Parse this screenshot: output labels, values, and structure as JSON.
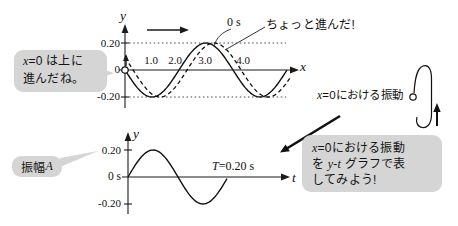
{
  "figure": {
    "top_graph": {
      "y_axis": "y",
      "x_axis": "x",
      "origin": "0",
      "tick_pos": "0.20",
      "tick_neg": "-0.20",
      "x_ticks": [
        "1.0",
        "2.0",
        "3.0",
        "4.0"
      ],
      "label_t0": "0 s",
      "label_advanced": "ちょっと進んだ!"
    },
    "bubble_moved_up": {
      "line1": [
        {
          "t": "x",
          "i": true
        },
        {
          "t": "=0 は上に",
          "i": false
        }
      ],
      "line2": "進んだね。"
    },
    "oscillation_label": [
      {
        "t": "x",
        "i": true
      },
      {
        "t": "=0における振動",
        "i": false
      }
    ],
    "bubble_yt": {
      "line1": [
        {
          "t": "x",
          "i": true
        },
        {
          "t": "=0における振動",
          "i": false
        }
      ],
      "line2": [
        {
          "t": "を ",
          "i": false
        },
        {
          "t": "y",
          "i": true
        },
        {
          "t": "-",
          "i": false
        },
        {
          "t": "t",
          "i": true
        },
        {
          "t": " グラフで表",
          "i": false
        }
      ],
      "line3": [
        {
          "t": "してみよう!",
          "i": false
        }
      ]
    },
    "bubble_amplitude": [
      {
        "t": "振幅",
        "i": false
      },
      {
        "t": "A",
        "i": true
      }
    ],
    "bottom_graph": {
      "y_axis": "y",
      "t_axis": "t",
      "origin": "0 s",
      "tick_pos": "0.20",
      "tick_neg": "-0.20",
      "period": [
        {
          "t": "T",
          "i": true
        },
        {
          "t": "=0.20 s",
          "i": false
        }
      ]
    }
  },
  "chart_data": [
    {
      "type": "line",
      "title": "wave snapshot y vs x",
      "xlabel": "x",
      "ylabel": "y",
      "x_ticks": [
        1.0,
        2.0,
        3.0,
        4.0
      ],
      "ylim": [
        -0.2,
        0.2
      ],
      "grid": "dotted lines at y=0.20 and y=-0.20",
      "series": [
        {
          "name": "0 s",
          "style": "solid",
          "amplitude": 0.2,
          "wavelength": 4.0,
          "phase_shift": 0.0,
          "x_range": [
            0,
            6.0
          ],
          "equation": "y = -0.20 sin(2*pi*x/4.0)"
        },
        {
          "name": "ちょっと進んだ!",
          "style": "dashed",
          "amplitude": 0.2,
          "wavelength": 4.0,
          "phase_shift": 0.3,
          "x_range": [
            0,
            6.15
          ],
          "equation": "y = -0.20 sin(2*pi*(x-0.3)/4.0)"
        }
      ],
      "annotations": [
        "rightward propagation arrow",
        "point at x=0 moves up (small arrow at origin)"
      ]
    },
    {
      "type": "line",
      "title": "oscillation at x=0, y vs t",
      "xlabel": "t",
      "ylabel": "y",
      "ylim": [
        -0.2,
        0.2
      ],
      "series": [
        {
          "name": "y(t) at x=0",
          "style": "solid",
          "amplitude": 0.2,
          "period": 0.2,
          "t_range": [
            0,
            0.2
          ],
          "equation": "y = 0.20 sin(2*pi*t/0.20)"
        }
      ],
      "annotations": [
        "T=0.20 s",
        "origin labeled 0 s",
        "amplitude A = 0.20"
      ]
    }
  ]
}
